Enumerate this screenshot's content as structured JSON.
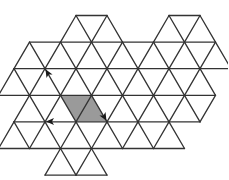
{
  "diagram": {
    "type": "triangular-lattice",
    "colors": {
      "background": "#ffffff",
      "line": "#333333",
      "shade": "#9a9a9a",
      "arrow": "#1a1a1a"
    },
    "lattice": {
      "side": 31,
      "row_height": 26.6,
      "origin_x": 14,
      "origin_y": 15.5
    },
    "rows": [
      {
        "row": 0,
        "segments": [
          [
            2,
            3
          ],
          [
            5,
            6
          ]
        ]
      },
      {
        "row": 1,
        "segments": [
          [
            0,
            6
          ]
        ]
      },
      {
        "row": 2,
        "segments": [
          [
            0,
            6
          ]
        ]
      },
      {
        "row": 3,
        "segments": [
          [
            0,
            6
          ]
        ]
      },
      {
        "row": 4,
        "segments": [
          [
            0,
            6
          ]
        ]
      },
      {
        "row": 5,
        "segments": [
          [
            0,
            4
          ]
        ]
      },
      {
        "row": 6,
        "segments": [
          [
            2,
            3
          ]
        ]
      }
    ],
    "triangles_up": [
      [
        1,
        2
      ],
      [
        2,
        2
      ],
      [
        4,
        5
      ],
      [
        5,
        5
      ],
      [
        0,
        1
      ],
      [
        1,
        1
      ],
      [
        2,
        1
      ],
      [
        3,
        1
      ],
      [
        4,
        1
      ],
      [
        5,
        1
      ],
      [
        0,
        0
      ],
      [
        1,
        0
      ],
      [
        2,
        0
      ],
      [
        3,
        0
      ],
      [
        4,
        0
      ],
      [
        5,
        0
      ],
      [
        6,
        0
      ],
      [
        0,
        -1
      ],
      [
        1,
        -1
      ],
      [
        2,
        -1
      ],
      [
        3,
        -1
      ],
      [
        4,
        -1
      ],
      [
        5,
        -1
      ],
      [
        0,
        -2
      ],
      [
        1,
        -2
      ],
      [
        2,
        -2
      ],
      [
        3,
        -2
      ],
      [
        4,
        -2
      ],
      [
        5,
        -2
      ],
      [
        1,
        -3
      ],
      [
        2,
        -3
      ],
      [
        3,
        -3
      ],
      [
        4,
        -3
      ],
      [
        2,
        -4
      ],
      [
        3,
        -4
      ]
    ],
    "shaded_rhombus": [
      [
        60.5,
        95
      ],
      [
        91.5,
        95
      ],
      [
        107,
        121.6
      ],
      [
        76,
        121.6
      ]
    ],
    "arrows": [
      {
        "name": "arrow-down-right",
        "from": [
          91.5,
          95
        ],
        "to": [
          107,
          121.6
        ]
      },
      {
        "name": "arrow-left",
        "from": [
          76,
          121.6
        ],
        "to": [
          45,
          121.6
        ]
      },
      {
        "name": "arrow-up-left",
        "from": [
          60.5,
          95
        ],
        "to": [
          45,
          68.4
        ]
      }
    ]
  }
}
